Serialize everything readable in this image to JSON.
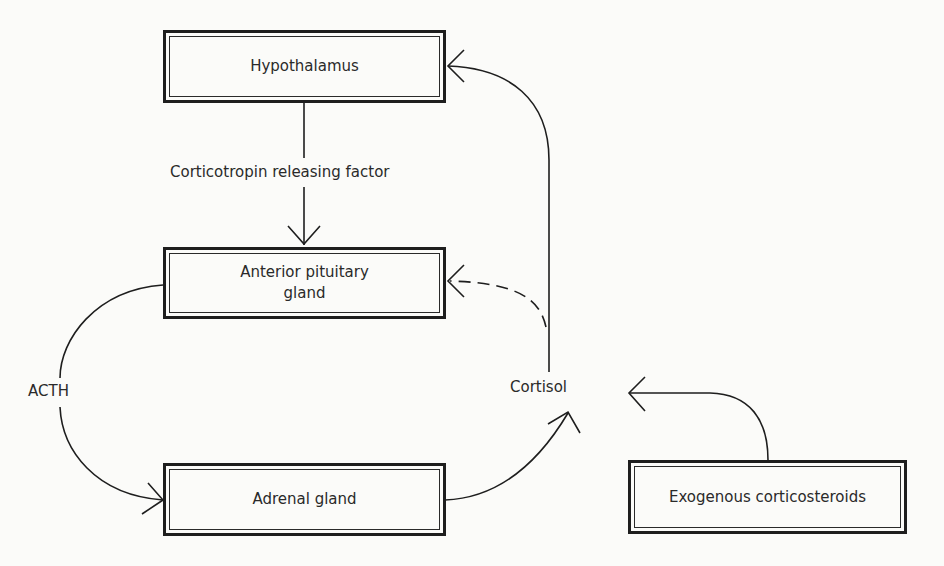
{
  "diagram": {
    "type": "feedback-loop flowchart",
    "nodes": {
      "hypothalamus": "Hypothalamus",
      "anterior_pituitary_line1": "Anterior pituitary",
      "anterior_pituitary_line2": "gland",
      "adrenal": "Adrenal gland",
      "exogenous": "Exogenous corticosteroids"
    },
    "edge_labels": {
      "crf": "Corticotropin releasing factor",
      "acth": "ACTH",
      "cortisol": "Cortisol"
    },
    "edges": [
      {
        "from": "Hypothalamus",
        "to": "Anterior pituitary gland",
        "label": "Corticotropin releasing factor",
        "style": "solid"
      },
      {
        "from": "Anterior pituitary gland",
        "to": "Adrenal gland",
        "label": "ACTH",
        "style": "solid"
      },
      {
        "from": "Adrenal gland",
        "to": "Cortisol",
        "style": "solid"
      },
      {
        "from": "Cortisol",
        "to": "Hypothalamus",
        "style": "solid"
      },
      {
        "from": "Cortisol",
        "to": "Anterior pituitary gland",
        "style": "dashed"
      },
      {
        "from": "Exogenous corticosteroids",
        "to": "Cortisol",
        "style": "solid"
      }
    ],
    "colors": {
      "line": "#1e1e1e",
      "background": "#fbfbf9"
    }
  }
}
